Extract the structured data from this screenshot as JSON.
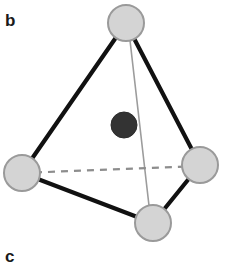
{
  "figure": {
    "panel_label_b": "b",
    "panel_label_c": "c",
    "caption_alt": "Tetrahedral cluster: four light vertex spheres with one dark interstitial sphere"
  },
  "colors": {
    "background": "#ffffff",
    "vertex_fill": "#d4d4d4",
    "vertex_stroke": "#9a9a9a",
    "center_fill": "#333333",
    "center_stroke": "#2b2b2b",
    "bond_solid": "#111111",
    "bond_thin": "#9c9c9c",
    "bond_dashed": "#8d8d8d",
    "label_color": "#1a1a1a"
  },
  "geometry": {
    "canvas": {
      "width": 226,
      "height": 268
    },
    "atoms": [
      {
        "id": "vertex-top",
        "cx": 126,
        "cy": 23,
        "r": 19,
        "kind": "vertex"
      },
      {
        "id": "vertex-left",
        "cx": 22,
        "cy": 173,
        "r": 19,
        "kind": "vertex"
      },
      {
        "id": "vertex-right",
        "cx": 200,
        "cy": 165,
        "r": 19,
        "kind": "vertex"
      },
      {
        "id": "vertex-bottom",
        "cx": 153,
        "cy": 223,
        "r": 19,
        "kind": "vertex"
      },
      {
        "id": "center-atom",
        "cx": 124,
        "cy": 125,
        "r": 13,
        "kind": "center"
      }
    ],
    "bonds": [
      {
        "id": "bond-top-left",
        "x1": 126,
        "y1": 23,
        "x2": 22,
        "y2": 173,
        "style": "solid",
        "width": 4.2
      },
      {
        "id": "bond-top-right",
        "x1": 126,
        "y1": 23,
        "x2": 200,
        "y2": 165,
        "style": "solid",
        "width": 4.2
      },
      {
        "id": "bond-left-bottom",
        "x1": 22,
        "y1": 173,
        "x2": 153,
        "y2": 223,
        "style": "solid",
        "width": 4.2
      },
      {
        "id": "bond-right-bottom",
        "x1": 200,
        "y1": 165,
        "x2": 153,
        "y2": 223,
        "style": "solid",
        "width": 4.2
      },
      {
        "id": "bond-top-bottom",
        "x1": 128,
        "y1": 23,
        "x2": 151,
        "y2": 223,
        "style": "thin",
        "width": 1.6
      },
      {
        "id": "bond-left-right",
        "x1": 22,
        "y1": 173,
        "x2": 200,
        "y2": 166,
        "style": "dashed",
        "width": 2.2,
        "dash": "7,6"
      }
    ]
  }
}
